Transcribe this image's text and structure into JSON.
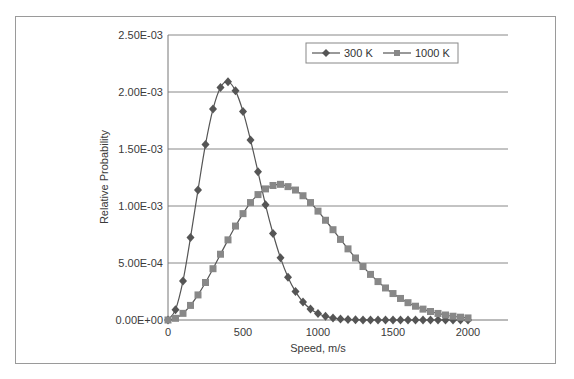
{
  "chart_data": {
    "type": "line",
    "title": "",
    "xlabel": "Speed, m/s",
    "ylabel": "Relative Probability",
    "xlim": [
      0,
      2000
    ],
    "ylim": [
      0,
      0.0025
    ],
    "x_ticks": [
      "0",
      "500",
      "1000",
      "1500",
      "2000"
    ],
    "y_ticks": [
      "0.00E+00",
      "5.00E-04",
      "1.00E-03",
      "1.50E-03",
      "2.00E-03",
      "2.50E-03"
    ],
    "grid": "horizontal",
    "legend_position": "top-right",
    "x": [
      0,
      50,
      100,
      150,
      200,
      250,
      300,
      350,
      400,
      450,
      500,
      550,
      600,
      650,
      700,
      750,
      800,
      850,
      900,
      950,
      1000,
      1050,
      1100,
      1150,
      1200,
      1250,
      1300,
      1350,
      1400,
      1450,
      1500,
      1550,
      1600,
      1650,
      1700,
      1750,
      1800,
      1850,
      1900,
      1950,
      2000
    ],
    "series": [
      {
        "name": "300 K",
        "marker": "diamond",
        "color": "#555555",
        "values": [
          0,
          9.09e-05,
          0.000343,
          0.000723,
          0.00114,
          0.00154,
          0.00185,
          0.00204,
          0.00209,
          0.00201,
          0.00183,
          0.00158,
          0.0013,
          0.00101,
          0.000759,
          0.000545,
          0.000376,
          0.000249,
          0.000158,
          9.65e-05,
          5.66e-05,
          3.19e-05,
          1.73e-05,
          9e-06,
          4.5e-06,
          2.2e-06,
          1e-06,
          4e-07,
          0,
          0,
          0,
          0,
          0,
          0,
          0,
          0,
          0,
          0,
          0,
          0,
          0
        ]
      },
      {
        "name": "1000 K",
        "marker": "square",
        "color": "#888888",
        "values": [
          0,
          1.48e-05,
          5.83e-05,
          0.000128,
          0.00022,
          0.000329,
          0.00045,
          0.000577,
          0.000703,
          0.000824,
          0.000933,
          0.00103,
          0.0011,
          0.00115,
          0.00118,
          0.00119,
          0.00117,
          0.00114,
          0.00109,
          0.00103,
          0.000955,
          0.000875,
          0.000792,
          0.000707,
          0.000624,
          0.000544,
          0.000469,
          0.0004,
          0.000337,
          0.000281,
          0.000232,
          0.000189,
          0.000152,
          0.000121,
          9.55e-05,
          7.45e-05,
          5.75e-05,
          4.39e-05,
          3.31e-05,
          2.47e-05,
          1.82e-05
        ]
      }
    ]
  }
}
